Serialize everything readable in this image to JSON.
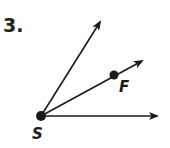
{
  "problem": {
    "number": "3."
  },
  "figure": {
    "type": "angle-diagram",
    "vertex": {
      "label": "S",
      "x": 41,
      "y": 116
    },
    "rays": [
      {
        "name": "upper-ray",
        "tip": {
          "x": 101,
          "y": 20
        }
      },
      {
        "name": "middle-ray",
        "through_point": {
          "label": "F",
          "x": 114,
          "y": 75
        },
        "tip": {
          "x": 143,
          "y": 60
        }
      },
      {
        "name": "horizontal-ray",
        "tip": {
          "x": 159,
          "y": 116
        }
      }
    ],
    "points": [
      {
        "label": "S"
      },
      {
        "label": "F"
      }
    ],
    "colors": {
      "stroke": "#1a1a1a",
      "background": "#ffffff"
    }
  }
}
